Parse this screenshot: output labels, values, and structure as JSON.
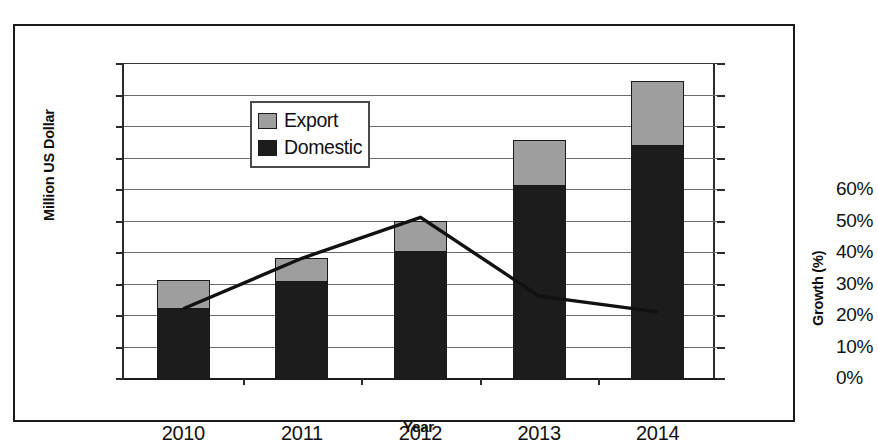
{
  "chart_data": {
    "type": "bar",
    "title": "",
    "subtitle": "",
    "xlabel": "Year",
    "ylabel": "Million US Dollar",
    "y2label": "Growth (%)",
    "categories": [
      "2010",
      "2011",
      "2012",
      "2013",
      "2014"
    ],
    "ylim": [
      0,
      500
    ],
    "ytick_step": 50,
    "yticks": [
      "0",
      "50",
      "100",
      "150",
      "200",
      "250",
      "300",
      "350",
      "400",
      "450",
      "500"
    ],
    "y2lim": [
      0,
      100
    ],
    "y2tick_step": 10,
    "y2ticks_labeled": [
      "0%",
      "10%",
      "20%",
      "30%",
      "40%",
      "50%",
      "60%"
    ],
    "grid": true,
    "grid_axis": "y",
    "legend_position": "upper-left-inside",
    "stacked": true,
    "series": [
      {
        "name": "Domestic",
        "type": "bar",
        "axis": "left",
        "color": "#1c1c1c",
        "values": [
          110,
          152,
          200,
          305,
          368
        ]
      },
      {
        "name": "Export",
        "type": "bar",
        "axis": "left",
        "color": "#9e9e9e",
        "values": [
          45,
          38,
          50,
          73,
          104
        ]
      },
      {
        "name": "Growth",
        "type": "line",
        "axis": "right",
        "color": "#111111",
        "values": [
          22,
          38,
          51,
          26,
          21
        ]
      }
    ],
    "totals": [
      155,
      190,
      250,
      378,
      472
    ],
    "annotations": []
  },
  "legend": {
    "items": [
      {
        "label": "Export",
        "color": "#9e9e9e"
      },
      {
        "label": "Domestic",
        "color": "#1c1c1c"
      }
    ]
  },
  "colors": {
    "domestic": "#1c1c1c",
    "export": "#9e9e9e",
    "line": "#111111",
    "grid": "#6b6b6b",
    "axis": "#2b2b2b",
    "frame": "#1a1a1a",
    "background": "#ffffff"
  }
}
